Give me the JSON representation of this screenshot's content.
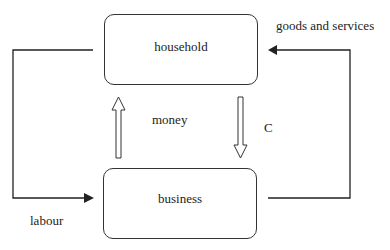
{
  "diagram": {
    "title": "",
    "nodes": {
      "household": {
        "label": "household"
      },
      "business": {
        "label": "business"
      }
    },
    "labels": {
      "goods_and_services": "goods and services",
      "labour": "labour",
      "money": "money",
      "c": "C"
    },
    "edges": [
      {
        "from": "business",
        "to": "household",
        "label": "goods and services",
        "style": "solid-arrow"
      },
      {
        "from": "household",
        "to": "business",
        "label": "labour",
        "style": "solid-arrow"
      },
      {
        "from": "business",
        "to": "household",
        "label": "money",
        "style": "hollow-arrow"
      },
      {
        "from": "household",
        "to": "business",
        "label": "C",
        "style": "hollow-arrow"
      }
    ],
    "colors": {
      "line": "#222222",
      "background": "#ffffff"
    }
  }
}
